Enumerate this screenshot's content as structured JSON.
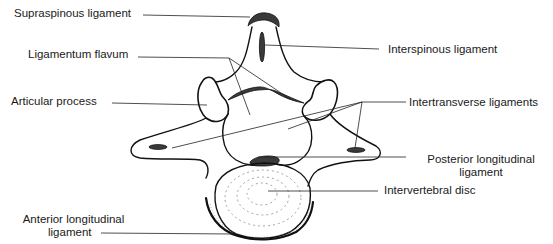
{
  "figure": {
    "labels": {
      "supraspinous": "Supraspinous ligament",
      "ligamentum_flavum": "Ligamentum flavum",
      "articular_process": "Articular process",
      "anterior_longitudinal_line1": "Anterior longitudinal",
      "anterior_longitudinal_line2": "ligament",
      "interspinous": "Interspinous ligament",
      "intertransverse": "Intertransverse ligaments",
      "posterior_longitudinal_line1": "Posterior longitudinal",
      "posterior_longitudinal_line2": "ligament",
      "intervertebral_disc": "Intervertebral disc"
    }
  }
}
